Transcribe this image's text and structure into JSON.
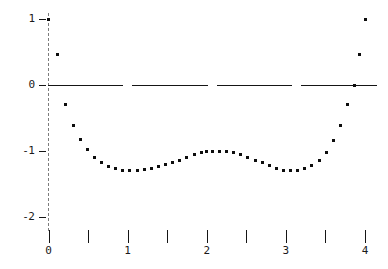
{
  "chart_data": {
    "type": "scatter",
    "title": "",
    "subtitle": "",
    "xlabel": "",
    "ylabel": "",
    "xlim": [
      0,
      4
    ],
    "ylim": [
      -2.2,
      1.15
    ],
    "grid": false,
    "legend": null,
    "marker": "square-dot",
    "marker_color": "#0d0d0d",
    "x_ticks_major": [
      0,
      1,
      2,
      3,
      4
    ],
    "x_ticks_major_labels": [
      "0",
      "1",
      "2",
      "3",
      "4"
    ],
    "x_ticks_minor": [
      0.5,
      1.5,
      2.5,
      3.5
    ],
    "y_ticks_major": [
      1,
      0,
      -1,
      -2
    ],
    "y_ticks_major_labels": [
      "1",
      "0",
      "-1",
      "-2"
    ],
    "zero_line": {
      "y": 0,
      "style": "dashed",
      "color": "#151515",
      "dashes": 4
    },
    "vertical_axis": {
      "x": 0,
      "style": "dashed",
      "color": "#7c7c7c"
    },
    "points": [
      {
        "x": 0.0,
        "y": 1.0
      },
      {
        "x": 0.11,
        "y": 0.46
      },
      {
        "x": 0.22,
        "y": -0.3
      },
      {
        "x": 0.31,
        "y": -0.62
      },
      {
        "x": 0.4,
        "y": -0.82
      },
      {
        "x": 0.49,
        "y": -0.98
      },
      {
        "x": 0.58,
        "y": -1.1
      },
      {
        "x": 0.67,
        "y": -1.18
      },
      {
        "x": 0.76,
        "y": -1.23
      },
      {
        "x": 0.85,
        "y": -1.27
      },
      {
        "x": 0.94,
        "y": -1.29
      },
      {
        "x": 1.03,
        "y": -1.3
      },
      {
        "x": 1.12,
        "y": -1.3
      },
      {
        "x": 1.21,
        "y": -1.28
      },
      {
        "x": 1.3,
        "y": -1.26
      },
      {
        "x": 1.39,
        "y": -1.23
      },
      {
        "x": 1.48,
        "y": -1.21
      },
      {
        "x": 1.57,
        "y": -1.18
      },
      {
        "x": 1.66,
        "y": -1.14
      },
      {
        "x": 1.75,
        "y": -1.1
      },
      {
        "x": 1.84,
        "y": -1.06
      },
      {
        "x": 1.93,
        "y": -1.03
      },
      {
        "x": 2.0,
        "y": -1.01
      },
      {
        "x": 2.07,
        "y": -1.0
      },
      {
        "x": 2.16,
        "y": -1.0
      },
      {
        "x": 2.25,
        "y": -1.01
      },
      {
        "x": 2.34,
        "y": -1.03
      },
      {
        "x": 2.43,
        "y": -1.06
      },
      {
        "x": 2.52,
        "y": -1.1
      },
      {
        "x": 2.61,
        "y": -1.14
      },
      {
        "x": 2.7,
        "y": -1.18
      },
      {
        "x": 2.79,
        "y": -1.22
      },
      {
        "x": 2.88,
        "y": -1.26
      },
      {
        "x": 2.97,
        "y": -1.29
      },
      {
        "x": 3.06,
        "y": -1.3
      },
      {
        "x": 3.15,
        "y": -1.3
      },
      {
        "x": 3.24,
        "y": -1.27
      },
      {
        "x": 3.33,
        "y": -1.22
      },
      {
        "x": 3.42,
        "y": -1.14
      },
      {
        "x": 3.51,
        "y": -1.02
      },
      {
        "x": 3.6,
        "y": -0.84
      },
      {
        "x": 3.69,
        "y": -0.62
      },
      {
        "x": 3.78,
        "y": -0.3
      },
      {
        "x": 3.87,
        "y": 0.0
      },
      {
        "x": 3.93,
        "y": 0.46
      },
      {
        "x": 4.0,
        "y": 1.0
      }
    ]
  }
}
